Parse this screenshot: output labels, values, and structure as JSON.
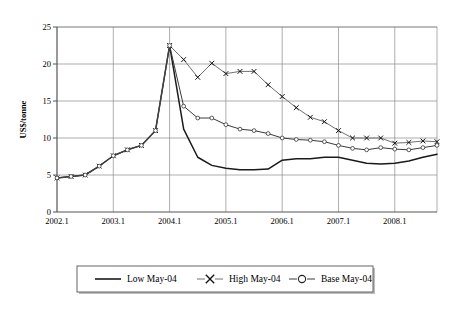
{
  "chart_data": {
    "type": "line",
    "title": "",
    "xlabel": "",
    "ylabel": "US$/tonne",
    "ylim": [
      0,
      25
    ],
    "yticks": [
      0,
      5,
      10,
      15,
      20,
      25
    ],
    "xtick_labels": [
      "2002.1",
      "2003.1",
      "2004.1",
      "2005.1",
      "2006.1",
      "2007.1",
      "2008.1"
    ],
    "grid": true,
    "legend_position": "bottom",
    "x": [
      "2002.1",
      "2002.2",
      "2002.3",
      "2002.4",
      "2003.1",
      "2003.2",
      "2003.3",
      "2003.4",
      "2004.1",
      "2004.2",
      "2004.3",
      "2004.4",
      "2005.1",
      "2005.2",
      "2005.3",
      "2005.4",
      "2006.1",
      "2006.2",
      "2006.3",
      "2006.4",
      "2007.1",
      "2007.2",
      "2007.3",
      "2007.4",
      "2008.1",
      "2008.2",
      "2008.3",
      "2008.4"
    ],
    "series": [
      {
        "name": "Low May-04",
        "marker": "none",
        "color": "#1a1a1a",
        "values": [
          4.6,
          4.8,
          5.0,
          6.2,
          7.6,
          8.4,
          9.0,
          11.0,
          22.5,
          11.2,
          7.4,
          6.3,
          5.9,
          5.7,
          5.7,
          5.8,
          7.0,
          7.2,
          7.2,
          7.4,
          7.4,
          7.0,
          6.6,
          6.5,
          6.6,
          6.9,
          7.4,
          7.8
        ]
      },
      {
        "name": "High May-04",
        "marker": "x",
        "color": "#707070",
        "values": [
          4.6,
          4.8,
          5.0,
          6.2,
          7.6,
          8.4,
          9.0,
          11.0,
          22.5,
          20.6,
          18.2,
          20.1,
          18.7,
          19.0,
          19.0,
          17.2,
          15.6,
          14.1,
          12.8,
          12.2,
          11.0,
          10.0,
          10.0,
          10.0,
          9.3,
          9.4,
          9.6,
          9.5
        ]
      },
      {
        "name": "Base May-04",
        "marker": "o",
        "color": "#3a3a3a",
        "values": [
          4.6,
          4.8,
          5.0,
          6.2,
          7.6,
          8.4,
          9.0,
          11.0,
          22.5,
          14.3,
          12.7,
          12.7,
          11.8,
          11.2,
          11.0,
          10.6,
          10.0,
          9.8,
          9.7,
          9.5,
          9.0,
          8.6,
          8.4,
          8.7,
          8.5,
          8.4,
          8.7,
          9.0
        ]
      }
    ]
  },
  "legend": {
    "items": [
      {
        "label": "Low May-04",
        "marker": "none"
      },
      {
        "label": "High May-04",
        "marker": "x"
      },
      {
        "label": "Base May-04",
        "marker": "o"
      }
    ]
  }
}
